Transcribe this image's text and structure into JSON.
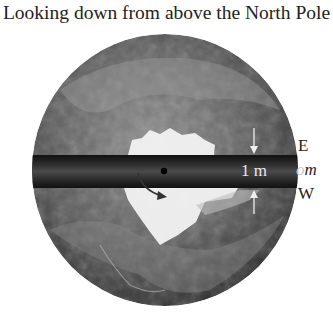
{
  "figure": {
    "title": "Looking down from above the North Pole",
    "band_label": "1 m",
    "labels": {
      "east": "E",
      "mass_ghost": "o",
      "mass": "m",
      "west": "W"
    },
    "colors": {
      "band": "#1a1a1a",
      "band_center": "#4a4a4a",
      "ice": "#f2f2f2",
      "globe_dark": "#2b2b2b",
      "globe_light": "#8a8a8a",
      "text": "#222222"
    }
  }
}
